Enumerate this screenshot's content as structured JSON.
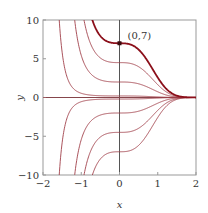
{
  "chart_data": {
    "type": "line",
    "title": "",
    "xlabel": "x",
    "ylabel": "y",
    "xlim": [
      -2,
      2
    ],
    "ylim": [
      -10,
      10
    ],
    "xticks": [
      -2,
      -1,
      0,
      1,
      2
    ],
    "yticks": [
      -10,
      -5,
      0,
      5,
      10
    ],
    "grid": false,
    "legend": null,
    "family_formula": "y = C*exp(-x^3)",
    "series": [
      {
        "name": "C=7",
        "C": 7,
        "highlight": true
      },
      {
        "name": "C=4.5",
        "C": 4.5
      },
      {
        "name": "C=2",
        "C": 2
      },
      {
        "name": "C=0.2",
        "C": 0.2
      },
      {
        "name": "C=0",
        "C": 0
      },
      {
        "name": "C=-0.2",
        "C": -0.2
      },
      {
        "name": "C=-2",
        "C": -2
      },
      {
        "name": "C=-4.5",
        "C": -4.5
      },
      {
        "name": "C=-7",
        "C": -7
      }
    ],
    "annotations": [
      {
        "text": "(0,7)",
        "x": 0,
        "y": 7,
        "marker": true
      }
    ]
  },
  "colors": {
    "curve": "#a0404a",
    "highlight": "#8b0f1a",
    "axis": "#555555",
    "frame": "#999999"
  }
}
